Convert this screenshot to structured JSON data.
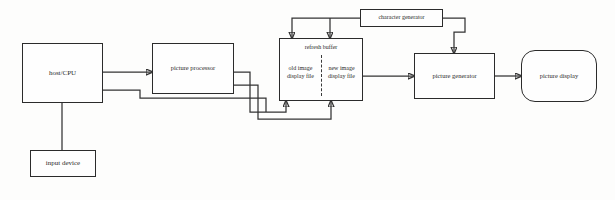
{
  "diagram": {
    "background_color": "#fdfdfc",
    "line_color": "#333333",
    "box_border_color": "#2b2b2b",
    "nodes": {
      "host_cpu": {
        "label": "host/CPU",
        "shape": "rectangle"
      },
      "input_device": {
        "label": "input device",
        "shape": "rectangle"
      },
      "picture_processor": {
        "label": "picture processor",
        "shape": "rectangle"
      },
      "refresh_buffer": {
        "title": "refresh buffer",
        "shape": "rectangle",
        "divider": "dashed-vertical",
        "left_cell": "old image\ndisplay file",
        "left_cell_line1": "old image",
        "left_cell_line2": "display file",
        "right_cell_line1": "new image",
        "right_cell_line2": "display file"
      },
      "character_generator": {
        "label": "character generator",
        "shape": "rectangle"
      },
      "picture_generator": {
        "label": "picture generator",
        "shape": "rectangle"
      },
      "picture_display": {
        "label": "picture display",
        "shape": "rounded-rectangle"
      }
    },
    "edges": [
      {
        "id": "host-to-processor",
        "from": "host/CPU",
        "to": "picture processor",
        "direction": "right",
        "arrow": true
      },
      {
        "id": "host-to-input",
        "from": "host/CPU",
        "to": "input device",
        "direction": "down",
        "arrow": false
      },
      {
        "id": "processor-to-buffer-old",
        "from": "picture processor",
        "to": "old image display file",
        "direction": "up-into-bottom",
        "arrow": true
      },
      {
        "id": "processor-to-buffer-new",
        "from": "picture processor",
        "to": "new image display file",
        "direction": "up-into-bottom",
        "arrow": true
      },
      {
        "id": "feedback-to-host",
        "from": "refresh buffer area",
        "to": "host/CPU",
        "direction": "left",
        "arrow": true
      },
      {
        "id": "chargen-to-buffer-old",
        "from": "character generator",
        "to": "old image display file",
        "direction": "down-into-top",
        "arrow": true
      },
      {
        "id": "chargen-to-buffer-new",
        "from": "character generator",
        "to": "new image display file",
        "direction": "down-into-top",
        "arrow": true
      },
      {
        "id": "chargen-to-picture-generator",
        "from": "character generator",
        "to": "picture generator",
        "direction": "down-into-top",
        "arrow": true
      },
      {
        "id": "buffer-to-picture-generator",
        "from": "refresh buffer",
        "to": "picture generator",
        "direction": "right",
        "arrow": true
      },
      {
        "id": "picture-generator-to-display",
        "from": "picture generator",
        "to": "picture display",
        "direction": "right",
        "arrow": true
      }
    ]
  }
}
